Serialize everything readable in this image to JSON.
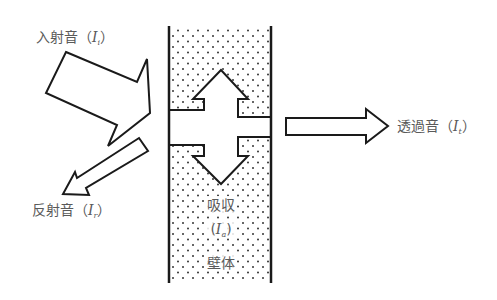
{
  "diagram": {
    "title": "",
    "colors": {
      "line": "#1a1a1a",
      "text": "#5a5a5a",
      "dots": "#333333",
      "background": "#ffffff"
    },
    "labels": {
      "incident": {
        "text": "入射音",
        "paren_open": "（",
        "symbol": "I",
        "subscript": "i",
        "paren_close": "）"
      },
      "reflected": {
        "text": "反射音",
        "paren_open": "（",
        "symbol": "I",
        "subscript": "r",
        "paren_close": "）"
      },
      "transmitted": {
        "text": "透過音",
        "paren_open": "（",
        "symbol": "I",
        "subscript": "t",
        "paren_close": "）"
      },
      "absorbed": {
        "text": "吸収",
        "paren_open": "(",
        "symbol": "I",
        "subscript": "a",
        "paren_close": ")"
      },
      "wall": {
        "text": "壁体"
      }
    },
    "arrows": [
      {
        "name": "incident",
        "direction": "into-wall",
        "label": "入射音 (Ii)"
      },
      {
        "name": "reflected",
        "direction": "away-from-wall",
        "label": "反射音 (Ir)"
      },
      {
        "name": "transmitted",
        "direction": "out-of-wall",
        "label": "透過音 (It)"
      },
      {
        "name": "absorbed-up",
        "direction": "up-inside-wall",
        "label": "吸収 (Ia)"
      },
      {
        "name": "absorbed-down",
        "direction": "down-inside-wall",
        "label": "吸収 (Ia)"
      }
    ]
  }
}
